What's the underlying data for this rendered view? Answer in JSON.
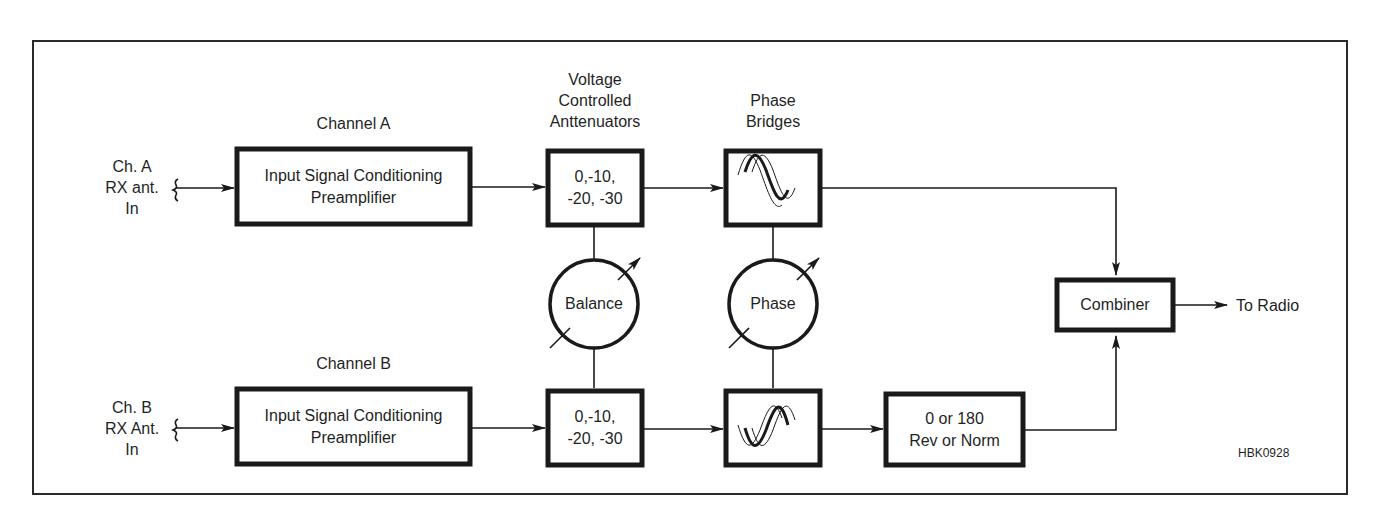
{
  "diagram": {
    "figure_id": "HBK0928",
    "colors": {
      "stroke": "#1a1a1a",
      "background": "#ffffff"
    },
    "inputs": {
      "a": {
        "lines": [
          "Ch. A",
          "RX ant.",
          "In"
        ]
      },
      "b": {
        "lines": [
          "Ch. B",
          "RX Ant.",
          "In"
        ]
      }
    },
    "section_labels": {
      "channel_a": "Channel A",
      "channel_b": "Channel B",
      "attenuators": [
        "Voltage",
        "Controlled",
        "Anttenuators"
      ],
      "phase_bridges": [
        "Phase",
        "Bridges"
      ]
    },
    "blocks": {
      "preamp_a": {
        "lines": [
          "Input Signal Conditioning",
          "Preamplifier"
        ]
      },
      "preamp_b": {
        "lines": [
          "Input Signal Conditioning",
          "Preamplifier"
        ]
      },
      "atten_a": {
        "lines": [
          "0,-10,",
          "-20, -30"
        ]
      },
      "atten_b": {
        "lines": [
          "0,-10,",
          "-20, -30"
        ]
      },
      "phase_bridge_a": {
        "icon": "sine-waves-icon"
      },
      "phase_bridge_b": {
        "icon": "sine-waves-icon"
      },
      "reverser": {
        "lines": [
          "0 or 180",
          "Rev or Norm"
        ]
      },
      "combiner": {
        "label": "Combiner"
      }
    },
    "controls": {
      "balance": {
        "label": "Balance",
        "icon": "variable-control-icon"
      },
      "phase": {
        "label": "Phase",
        "icon": "variable-control-icon"
      }
    },
    "output": {
      "label": "To Radio"
    }
  }
}
